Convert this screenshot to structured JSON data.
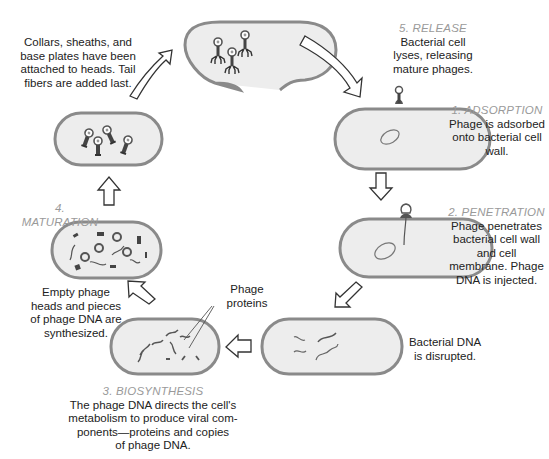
{
  "diagram": {
    "stages": [
      {
        "id": "adsorption",
        "name": "1. ADSORPTION",
        "description": "Phage is adsorbed\nonto bacterial cell\nwall."
      },
      {
        "id": "penetration",
        "name": "2. PENETRATION",
        "description": "Phage penetrates\nbacterial cell wall\nand cell\nmembrane.  Phage\nDNA is injected."
      },
      {
        "id": "biosynthesis",
        "name": "3. BIOSYNTHESIS",
        "description": "The phage DNA directs the cell's\nmetabolism to produce viral com-\nponents—proteins and copies\nof phage DNA."
      },
      {
        "id": "maturation",
        "name": "4. MATURATION",
        "description": ""
      },
      {
        "id": "release",
        "name": "5. RELEASE",
        "description": "Bacterial cell\nlyses, releasing\nmature phages."
      }
    ],
    "notes": {
      "disrupted": "Bacterial DNA\nis disrupted.",
      "synthesized": "Empty phage\nheads and pieces\nof phage DNA are\nsynthesized.",
      "assembled": "Collars, sheaths, and\nbase plates have been\nattached to heads.  Tail\nfibers are added last.",
      "phage_proteins": "Phage\nproteins"
    },
    "colors": {
      "cell_fill": "#ededed",
      "cell_wall": "#8a8a8a",
      "stage_label": "#9a9a9a",
      "text": "#222222",
      "dna": "#555555"
    },
    "icons": [
      "bacterial-cell",
      "bacteriophage",
      "hollow-arrow",
      "dna-strand"
    ]
  }
}
